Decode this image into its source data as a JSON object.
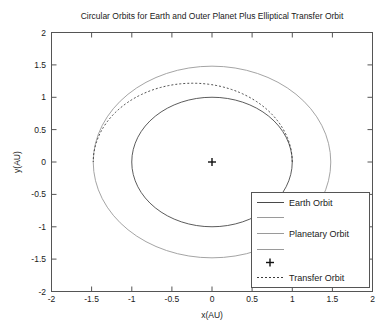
{
  "chart_data": {
    "type": "line",
    "title": "Circular Orbits for Earth and Outer Planet Plus Elliptical Transfer Orbit",
    "xlabel": "x(AU)",
    "ylabel": "y(AU)",
    "xlim": [
      -2,
      2
    ],
    "ylim": [
      -2,
      2
    ],
    "xticks": [
      "-2",
      "-1.5",
      "-1",
      "-0.5",
      "0",
      "0.5",
      "1",
      "1.5",
      "2"
    ],
    "yticks": [
      "-2",
      "-1.5",
      "-1",
      "-0.5",
      "0",
      "0.5",
      "1",
      "1.5",
      "2"
    ],
    "xtick_values": [
      -2,
      -1.5,
      -1,
      -0.5,
      0,
      0.5,
      1,
      1.5,
      2
    ],
    "ytick_values": [
      -2,
      -1.5,
      -1,
      -0.5,
      0,
      0.5,
      1,
      1.5,
      2
    ],
    "grid": false,
    "legend_position": "lower-right",
    "series": [
      {
        "name": "Earth Orbit",
        "shape": "circle",
        "radius_au": 1.0,
        "center_au": [
          0,
          0
        ],
        "style": "solid",
        "color": "#4a4a4a"
      },
      {
        "name": "Planetary Orbit",
        "shape": "circle",
        "radius_au": 1.48,
        "center_au": [
          0,
          0
        ],
        "style": "solid",
        "color": "#9a9a9a"
      },
      {
        "name": "Sun",
        "shape": "marker",
        "marker": "plus",
        "point_au": [
          0,
          0
        ],
        "color": "#111111"
      },
      {
        "name": "Transfer Orbit",
        "shape": "half-ellipse",
        "perihelion_au": 1.0,
        "aphelion_au": 1.48,
        "semi_major_au": 1.24,
        "semi_minor_au": 1.2166,
        "center_au": [
          -0.24,
          0
        ],
        "style": "dashed",
        "color": "#3a3a3a"
      }
    ],
    "annotations": []
  },
  "legend": {
    "entries": [
      {
        "label": "Earth Orbit",
        "key": "solid-dark"
      },
      {
        "label": "",
        "key": "solid-gray-blank-1"
      },
      {
        "label": "Planetary Orbit",
        "key": "solid-gray"
      },
      {
        "label": "",
        "key": "solid-gray-blank-2"
      },
      {
        "label": "",
        "key": "plus-marker"
      },
      {
        "label": "Transfer Orbit",
        "key": "dashed"
      }
    ]
  }
}
